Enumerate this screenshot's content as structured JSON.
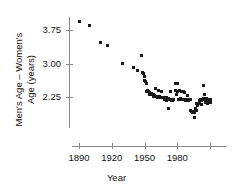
{
  "chart_data": {
    "type": "scatter",
    "title": "",
    "xlabel": "Year",
    "ylabel": "Men's Age – Women's Age (years)",
    "ylabel_line1": "Men's Age – Women's",
    "ylabel_line2": "Age (years)",
    "xlim": [
      1885,
      2015
    ],
    "ylim": [
      1.55,
      4.05
    ],
    "grid": false,
    "legend": null,
    "marker_color": "#1a1a1a",
    "axis_color": "#8a8a8a",
    "x_ticks": [
      {
        "value": 1890,
        "label": "1890"
      },
      {
        "value": 1920,
        "label": "1920"
      },
      {
        "value": 1950,
        "label": "1950"
      },
      {
        "value": 1980,
        "label": "1980"
      },
      {
        "value": 2010,
        "label": ""
      }
    ],
    "y_ticks": [
      {
        "value": 2.25,
        "label": "2.25"
      },
      {
        "value": 3.0,
        "label": "3.00"
      },
      {
        "value": 3.75,
        "label": "3.75"
      }
    ],
    "x": [
      1890,
      1900,
      1910,
      1916,
      1930,
      1940,
      1944,
      1947,
      1948,
      1949,
      1950,
      1950,
      1951,
      1952,
      1952,
      1953,
      1954,
      1955,
      1955,
      1956,
      1957,
      1958,
      1958,
      1959,
      1960,
      1960,
      1961,
      1962,
      1963,
      1963,
      1964,
      1965,
      1966,
      1966,
      1967,
      1968,
      1968,
      1969,
      1970,
      1970,
      1971,
      1972,
      1972,
      1973,
      1974,
      1974,
      1975,
      1976,
      1976,
      1977,
      1978,
      1978,
      1979,
      1980,
      1980,
      1981,
      1982,
      1982,
      1983,
      1984,
      1984,
      1985,
      1986,
      1986,
      1987,
      1988,
      1988,
      1989,
      1990,
      1990,
      1991,
      1992,
      1992,
      1993,
      1994,
      1994,
      1995,
      1996,
      1996,
      1997,
      1998,
      1998,
      1999,
      2000,
      2000,
      2001,
      2002,
      2002,
      2003,
      2004,
      2004,
      2005,
      2006,
      2006,
      2007,
      2008,
      2008,
      2009,
      2010,
      2010
    ],
    "y": [
      3.93,
      3.85,
      3.48,
      3.4,
      3.0,
      2.9,
      2.85,
      3.18,
      2.8,
      2.78,
      2.72,
      2.62,
      2.6,
      2.55,
      2.38,
      2.4,
      2.37,
      2.36,
      2.3,
      2.32,
      2.31,
      2.3,
      2.26,
      2.28,
      2.44,
      2.27,
      2.26,
      2.25,
      2.4,
      2.25,
      2.26,
      2.25,
      2.38,
      2.24,
      2.25,
      2.24,
      2.2,
      2.22,
      2.23,
      2.18,
      2.2,
      2.0,
      2.22,
      2.2,
      2.38,
      2.2,
      2.18,
      2.2,
      2.18,
      2.19,
      2.56,
      2.4,
      2.3,
      2.56,
      2.38,
      2.2,
      2.4,
      2.2,
      2.22,
      2.38,
      2.2,
      2.2,
      2.37,
      2.2,
      2.36,
      2.2,
      2.18,
      2.28,
      2.2,
      2.18,
      2.2,
      1.95,
      2.2,
      1.92,
      1.93,
      1.9,
      1.92,
      1.9,
      1.8,
      2.0,
      1.95,
      2.1,
      2.05,
      2.18,
      2.1,
      2.2,
      2.08,
      2.18,
      2.2,
      2.5,
      2.22,
      2.3,
      2.2,
      2.12,
      2.22,
      2.2,
      2.1,
      2.18,
      2.2,
      2.12
    ]
  }
}
